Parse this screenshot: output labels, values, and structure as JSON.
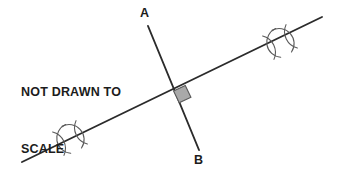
{
  "canvas": {
    "width": 338,
    "height": 177,
    "background": "#ffffff"
  },
  "annotation": {
    "line1": "NOT DRAWN TO",
    "line2": "SCALE",
    "color": "#1c1c1c"
  },
  "labels": {
    "a": "A",
    "b": "B"
  },
  "figure": {
    "type": "perpendicular-bisector-construction",
    "stroke_color": "#2b2b2b",
    "arc_color": "#5a5a5a",
    "right_angle_fill": "#a9a9a9",
    "right_angle_stroke": "#595959",
    "transversal_line": {
      "name": "diagonal-line",
      "x1": 22,
      "y1": 162,
      "x2": 322,
      "y2": 17,
      "width": 1.9
    },
    "segment_ab": {
      "name": "segment-AB",
      "x1": 148,
      "y1": 26,
      "x2": 199,
      "y2": 150,
      "width": 1.9
    },
    "intersection": {
      "x": 174,
      "y": 92
    },
    "right_angle_marker": {
      "x": 174,
      "y": 88,
      "size": 13
    },
    "tick_marks": [
      {
        "name": "arc-mark-left",
        "cx": 70,
        "cy": 138
      },
      {
        "name": "arc-mark-right",
        "cx": 280,
        "cy": 42
      }
    ]
  }
}
